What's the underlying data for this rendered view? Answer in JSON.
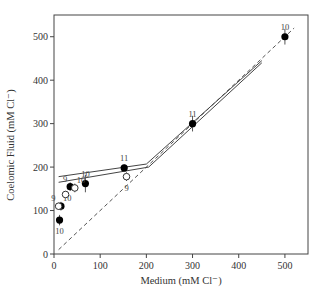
{
  "chart_data": {
    "type": "scatter",
    "title": "",
    "xlabel": "Medium (mM Cl⁻)",
    "ylabel": "Coelomic Fluid (mM Cl⁻)",
    "xlim": [
      0,
      550
    ],
    "ylim": [
      0,
      550
    ],
    "xticks": [
      0,
      100,
      200,
      300,
      400,
      500
    ],
    "yticks": [
      0,
      100,
      200,
      300,
      400,
      500
    ],
    "grid": false,
    "legend": "none",
    "series": [
      {
        "name": "filled",
        "marker": "filled-circle",
        "points": [
          {
            "x": 12,
            "y": 78,
            "n": "10",
            "label_pos": "below",
            "err": 12
          },
          {
            "x": 15,
            "y": 110,
            "n": "10",
            "label_pos": "above-right",
            "err": 10
          },
          {
            "x": 35,
            "y": 155,
            "n": "9",
            "label_pos": "above-left",
            "err": 10
          },
          {
            "x": 68,
            "y": 162,
            "n": "10",
            "label_pos": "above",
            "err": 20
          },
          {
            "x": 152,
            "y": 198,
            "n": "11",
            "label_pos": "above",
            "err": 8
          },
          {
            "x": 300,
            "y": 300,
            "n": "11",
            "label_pos": "above",
            "err": 18
          },
          {
            "x": 500,
            "y": 500,
            "n": "10",
            "label_pos": "above",
            "err": 18
          }
        ]
      },
      {
        "name": "open",
        "marker": "open-circle",
        "points": [
          {
            "x": 10,
            "y": 110,
            "n": "9",
            "label_pos": "above-left",
            "err": 8
          },
          {
            "x": 25,
            "y": 137,
            "n": "",
            "label_pos": "none",
            "err": 8
          },
          {
            "x": 45,
            "y": 152,
            "n": "10",
            "label_pos": "above-right",
            "err": 10
          },
          {
            "x": 157,
            "y": 178,
            "n": "9",
            "label_pos": "below",
            "err": 10
          }
        ]
      }
    ],
    "lines": [
      {
        "name": "identity",
        "style": "dashed",
        "points": [
          [
            10,
            10
          ],
          [
            520,
            520
          ]
        ]
      },
      {
        "name": "fit-lower",
        "style": "solid",
        "points": [
          [
            10,
            165
          ],
          [
            205,
            200
          ],
          [
            450,
            440
          ]
        ]
      },
      {
        "name": "fit-upper",
        "style": "solid",
        "points": [
          [
            10,
            178
          ],
          [
            200,
            207
          ],
          [
            450,
            445
          ]
        ]
      }
    ]
  }
}
